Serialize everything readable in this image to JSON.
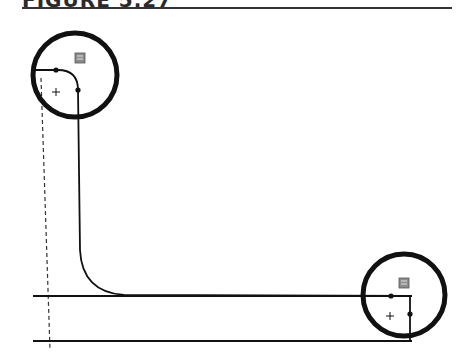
{
  "figure": {
    "title": "FIGURE 5.27",
    "colors": {
      "ink": "#111111",
      "badge": "#8c8c8c",
      "dashed": "#333333"
    }
  },
  "elements": {
    "highlight_circles": [
      {
        "id": "top-left",
        "cx": 75,
        "cy": 75,
        "r": 42
      },
      {
        "id": "bottom-right",
        "cx": 404,
        "cy": 295,
        "r": 41
      }
    ],
    "sketch_path": "M 33 70 L 58 70 Q 78 70 78 90 L 80 250 Q 82 292 124 295 L 410 296 L 410 341",
    "fillets": [
      {
        "id": "fillet-top-left",
        "center_mark": [
          56,
          92
        ],
        "endpoints": [
          [
            56,
            70
          ],
          [
            78,
            90
          ]
        ],
        "badge": [
          80,
          58
        ]
      },
      {
        "id": "fillet-bottom-right",
        "center_mark": [
          390,
          316
        ],
        "endpoints": [
          [
            391,
            296
          ],
          [
            410,
            314
          ]
        ],
        "badge": [
          404,
          283
        ]
      }
    ],
    "horizontal_lines": [
      {
        "id": "upper-line",
        "x1": 33,
        "y1": 296,
        "x2": 412,
        "y2": 296
      },
      {
        "id": "lower-line",
        "x1": 33,
        "y1": 341,
        "x2": 412,
        "y2": 341
      }
    ],
    "construction_line": {
      "x1": 41,
      "y1": 78,
      "x2": 50,
      "y2": 350
    }
  }
}
